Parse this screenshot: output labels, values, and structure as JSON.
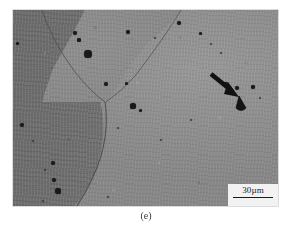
{
  "figure": {
    "caption": "(e)",
    "kind": "micrograph",
    "modality": "optical-metallography",
    "background_color": "#ffffff"
  },
  "micrograph": {
    "alt_description": "Grayscale metallographic micrograph showing three grains meeting at a triple junction, with scattered dark second-phase particles and a black arrow marking one particle.",
    "frame": {
      "x": 13,
      "y": 10,
      "width": 265,
      "height": 196
    },
    "grains": [
      {
        "id": "grain-left",
        "label": "dark grain (left)",
        "tone": "#707070"
      },
      {
        "id": "grain-upperleft",
        "label": "mid grain (upper left)",
        "tone": "#888888"
      },
      {
        "id": "grain-matrix",
        "label": "light matrix grain (right)",
        "tone": "#8c8c8c"
      }
    ],
    "boundary_color": "#4a4a4a",
    "particle_color": "#1a1a1a",
    "particles": [
      {
        "cx": 62,
        "cy": 23,
        "r": 2.4
      },
      {
        "cx": 66,
        "cy": 30,
        "r": 1.6
      },
      {
        "cx": 75,
        "cy": 44,
        "r": 3.6
      },
      {
        "cx": 4,
        "cy": 33,
        "r": 1.5
      },
      {
        "cx": 115,
        "cy": 22,
        "r": 2.0
      },
      {
        "cx": 142,
        "cy": 28,
        "r": 1.4
      },
      {
        "cx": 166,
        "cy": 13,
        "r": 2.0
      },
      {
        "cx": 187,
        "cy": 23,
        "r": 1.5
      },
      {
        "cx": 198,
        "cy": 34,
        "r": 1.4
      },
      {
        "cx": 208,
        "cy": 43,
        "r": 1.2
      },
      {
        "cx": 93,
        "cy": 74,
        "r": 2.0
      },
      {
        "cx": 113,
        "cy": 73,
        "r": 1.5
      },
      {
        "cx": 120,
        "cy": 96,
        "r": 2.6
      },
      {
        "cx": 127,
        "cy": 100,
        "r": 1.5
      },
      {
        "cx": 213,
        "cy": 74,
        "r": 1.6
      },
      {
        "cx": 224,
        "cy": 78,
        "r": 2.2
      },
      {
        "cx": 240,
        "cy": 77,
        "r": 1.8
      },
      {
        "cx": 9,
        "cy": 115,
        "r": 2.2
      },
      {
        "cx": 20,
        "cy": 131,
        "r": 1.3
      },
      {
        "cx": 32,
        "cy": 160,
        "r": 1.3
      },
      {
        "cx": 40,
        "cy": 153,
        "r": 2.0
      },
      {
        "cx": 41,
        "cy": 170,
        "r": 2.2
      },
      {
        "cx": 45,
        "cy": 181,
        "r": 2.6
      },
      {
        "cx": 30,
        "cy": 191,
        "r": 1.4
      },
      {
        "cx": 95,
        "cy": 187,
        "r": 1.4
      },
      {
        "cx": 105,
        "cy": 118,
        "r": 1.2
      },
      {
        "cx": 148,
        "cy": 130,
        "r": 1.1
      },
      {
        "cx": 178,
        "cy": 110,
        "r": 1.1
      },
      {
        "cx": 247,
        "cy": 88,
        "r": 1.3
      }
    ],
    "arrow": {
      "label": "annotation-arrow",
      "color": "#111111",
      "tail_x": 198,
      "tail_y": 64,
      "head_x": 223,
      "head_y": 84,
      "target_particle": {
        "cx": 228,
        "cy": 93,
        "rx": 4.5,
        "ry": 7
      }
    }
  },
  "scale_bar": {
    "label": "30µm",
    "value": 30,
    "unit": "µm",
    "line_color": "#1b1b1b",
    "box_color": "#f2f2f2"
  }
}
